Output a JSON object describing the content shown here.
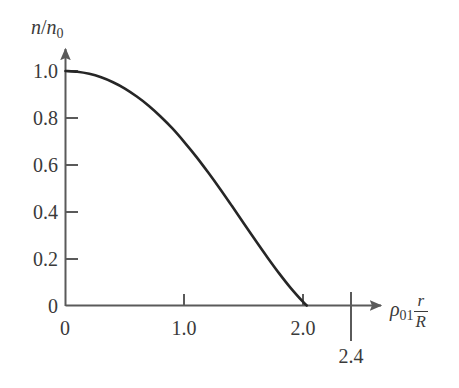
{
  "chart_data": {
    "type": "line",
    "title": "",
    "subtitle": "",
    "xlabel": "rho_01 r/R",
    "ylabel": "n/n_0",
    "xlabel_parts": {
      "rho": "ρ",
      "rho_sub": "01",
      "frac_num": "r",
      "frac_den": "R"
    },
    "ylabel_parts": {
      "n": "n",
      "slash": "/",
      "n2": "n",
      "n2_sub": "0"
    },
    "xlim": [
      0,
      2.85
    ],
    "ylim": [
      0,
      1.12
    ],
    "xticks": [
      0,
      1.0,
      2.0
    ],
    "xtick_labels": [
      "0",
      "1.0",
      "2.0"
    ],
    "yticks": [
      0,
      0.2,
      0.4,
      0.6,
      0.8,
      1.0
    ],
    "ytick_labels": [
      "0",
      "0.2",
      "0.4",
      "0.6",
      "0.8",
      "1.0"
    ],
    "grid": false,
    "legend": null,
    "annotations": [
      {
        "name": "zero-crossing",
        "label": "2.4",
        "x": 2.4,
        "y": 0,
        "kind": "drop-line"
      }
    ],
    "series": [
      {
        "name": "n/n0 vs rho01 r/R",
        "color": "#262626",
        "linewidth": 2.6,
        "x": [
          0.0,
          0.1,
          0.2,
          0.3,
          0.4,
          0.5,
          0.6,
          0.7,
          0.8,
          0.9,
          1.0,
          1.1,
          1.2,
          1.3,
          1.4,
          1.5,
          1.6,
          1.7,
          1.8,
          1.9,
          2.0,
          2.1,
          2.2,
          2.3,
          2.4
        ],
        "y": [
          1.0,
          0.997,
          0.988,
          0.973,
          0.952,
          0.925,
          0.891,
          0.852,
          0.806,
          0.755,
          0.697,
          0.635,
          0.568,
          0.498,
          0.425,
          0.351,
          0.277,
          0.205,
          0.136,
          0.072,
          0.015,
          -0.034,
          -0.074,
          -0.103,
          -0.119
        ]
      }
    ]
  },
  "axes": {
    "x_axis_name": "x-axis",
    "y_axis_name": "y-axis",
    "arrow_style": "filled-arrowhead"
  },
  "colors": {
    "curve": "#262626",
    "axis": "#5a5a5a",
    "text": "#3a3a3a",
    "background": "#ffffff"
  }
}
